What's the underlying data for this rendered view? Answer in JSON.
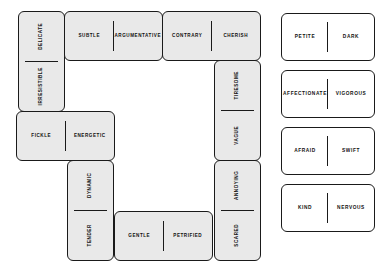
{
  "canvas": {
    "width": 387,
    "height": 276,
    "background": "#ffffff"
  },
  "style": {
    "tile_fill_placed": "#e9e9e9",
    "tile_fill_tray": "#ffffff",
    "tile_border": "#1a1a1a",
    "text_color": "#111111"
  },
  "board": {
    "name": "domino-ring-layout",
    "description": "Placed dominoes forming a closed rectangular ring",
    "tiles": [
      {
        "id": "t1",
        "orientation": "vertical",
        "placed": true,
        "values": [
          "DELICATE",
          "IRRESISTIBLE"
        ]
      },
      {
        "id": "t2",
        "orientation": "horizontal",
        "placed": true,
        "values": [
          "SUBTLE",
          "ARGUMENTATIVE"
        ]
      },
      {
        "id": "t3",
        "orientation": "horizontal",
        "placed": true,
        "values": [
          "CONTRARY",
          "CHERISH"
        ]
      },
      {
        "id": "t4",
        "orientation": "vertical",
        "placed": true,
        "values": [
          "TIRESOME",
          "VAGUE"
        ]
      },
      {
        "id": "t5",
        "orientation": "vertical",
        "placed": true,
        "values": [
          "ANNOYING",
          "SCARED"
        ]
      },
      {
        "id": "t6",
        "orientation": "horizontal",
        "placed": true,
        "values": [
          "GENTLE",
          "PETRIFIED"
        ]
      },
      {
        "id": "t7",
        "orientation": "vertical",
        "placed": true,
        "values": [
          "DYNAMIC",
          "TENDER"
        ]
      },
      {
        "id": "t8",
        "orientation": "horizontal",
        "placed": true,
        "values": [
          "FICKLE",
          "ENERGETIC"
        ]
      }
    ]
  },
  "tray": {
    "name": "available-dominoes",
    "tiles": [
      {
        "id": "s1",
        "orientation": "horizontal",
        "placed": false,
        "values": [
          "PETITE",
          "DARK"
        ]
      },
      {
        "id": "s2",
        "orientation": "horizontal",
        "placed": false,
        "values": [
          "AFFECTIONATE",
          "VIGOROUS"
        ]
      },
      {
        "id": "s3",
        "orientation": "horizontal",
        "placed": false,
        "values": [
          "AFRAID",
          "SWIFT"
        ]
      },
      {
        "id": "s4",
        "orientation": "horizontal",
        "placed": false,
        "values": [
          "KIND",
          "NERVOUS"
        ]
      }
    ]
  }
}
